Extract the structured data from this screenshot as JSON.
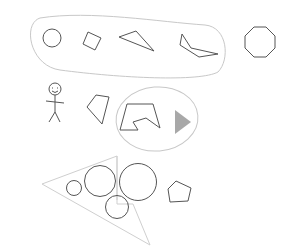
{
  "canvas": {
    "width": 293,
    "height": 252,
    "background": "#ffffff"
  },
  "colors": {
    "shape_stroke": "#555555",
    "group_stroke": "#c8c8c8",
    "filled_triangle": "#a8a8a8"
  },
  "groups": [
    {
      "id": "top-group",
      "kind": "rounded-capsule",
      "contains": [
        "circle",
        "square",
        "triangle",
        "concave-polygon"
      ]
    },
    {
      "id": "middle-group",
      "kind": "ellipse",
      "contains": [
        "concave-hexagon",
        "filled-triangle"
      ]
    },
    {
      "id": "bottom-group",
      "kind": "large-triangle",
      "contains": [
        "small-circle",
        "medium-circle",
        "large-circle",
        "lower-circle"
      ]
    }
  ],
  "shapes": [
    {
      "id": "circle",
      "type": "circle"
    },
    {
      "id": "square",
      "type": "rotated-square"
    },
    {
      "id": "triangle",
      "type": "triangle"
    },
    {
      "id": "concave-polygon",
      "type": "concave-polygon"
    },
    {
      "id": "octagon",
      "type": "octagon"
    },
    {
      "id": "stick-figure",
      "type": "stick-figure"
    },
    {
      "id": "quadrilateral",
      "type": "quadrilateral"
    },
    {
      "id": "concave-hexagon",
      "type": "concave-polygon"
    },
    {
      "id": "filled-triangle",
      "type": "filled-triangle"
    },
    {
      "id": "small-circle",
      "type": "circle"
    },
    {
      "id": "medium-circle",
      "type": "circle"
    },
    {
      "id": "large-circle",
      "type": "circle"
    },
    {
      "id": "lower-circle",
      "type": "circle"
    },
    {
      "id": "pentagon",
      "type": "pentagon"
    }
  ]
}
